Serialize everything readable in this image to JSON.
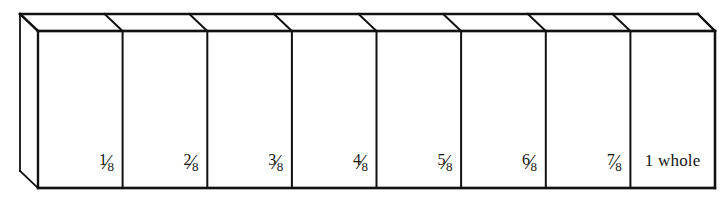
{
  "figure": {
    "line_color": "#111111",
    "face_color": "#ffffff",
    "background_color": "#ffffff",
    "total_parts": 8,
    "denominator": "8"
  },
  "geometry": {
    "front_left_x": 38,
    "front_right_x": 715,
    "front_top_y": 31,
    "front_bottom_y": 188,
    "back_left_x": 20,
    "back_right_x": 698,
    "back_top_y": 14,
    "back_bottom_y": 171,
    "cell_width": 84.625,
    "divider_x": [
      122.6,
      207.3,
      291.9,
      376.5,
      461.1,
      545.8,
      630.4
    ]
  },
  "cells": [
    {
      "index": 1,
      "numerator": "1",
      "slash": "⁄",
      "denominator": "8",
      "label": "1/8",
      "type": "fraction"
    },
    {
      "index": 2,
      "numerator": "2",
      "slash": "⁄",
      "denominator": "8",
      "label": "2/8",
      "type": "fraction"
    },
    {
      "index": 3,
      "numerator": "3",
      "slash": "⁄",
      "denominator": "8",
      "label": "3/8",
      "type": "fraction"
    },
    {
      "index": 4,
      "numerator": "4",
      "slash": "⁄",
      "denominator": "8",
      "label": "4/8",
      "type": "fraction"
    },
    {
      "index": 5,
      "numerator": "5",
      "slash": "⁄",
      "denominator": "8",
      "label": "5/8",
      "type": "fraction"
    },
    {
      "index": 6,
      "numerator": "6",
      "slash": "⁄",
      "denominator": "8",
      "label": "6/8",
      "type": "fraction"
    },
    {
      "index": 7,
      "numerator": "7",
      "slash": "⁄",
      "denominator": "8",
      "label": "7/8",
      "type": "fraction"
    },
    {
      "index": 8,
      "whole_label": "1 whole",
      "type": "whole"
    }
  ]
}
